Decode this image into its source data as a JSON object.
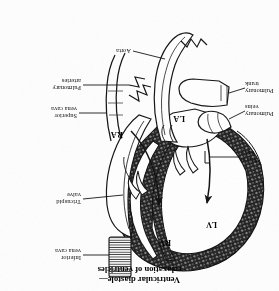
{
  "figure": {
    "orientation_note": "plate printed upside-down",
    "caption_line1": "Ventricular diastole—",
    "caption_line2": "relaxation of ventricles"
  },
  "chambers": [
    {
      "abbr": "LV",
      "name": "left ventricle"
    },
    {
      "abbr": "RV",
      "name": "right ventricle"
    },
    {
      "abbr": "LA",
      "name": "left atrium"
    },
    {
      "abbr": "RA",
      "name": "right atrium"
    }
  ],
  "labels": {
    "inferior_vena_cava_line1": "Inferior",
    "inferior_vena_cava_line2": "vena cava",
    "tricuspid_valve_line1": "Tricuspid",
    "tricuspid_valve_line2": "valve",
    "superior_vena_cava_line1": "Superior",
    "superior_vena_cava_line2": "vena cava",
    "pulmonary_arteries_line1": "Pulmonary",
    "pulmonary_arteries_line2": "arteries",
    "aorta": "Aorta",
    "mitral_valve_line1": "Mitral",
    "mitral_valve_line2": "valve",
    "pulmonary_veins_line1": "Pulmonary",
    "pulmonary_veins_line2": "veins",
    "pulmonary_trunk_line1": "Pulmonary",
    "pulmonary_trunk_line2": "trunk"
  },
  "colors": {
    "ink": "#111111",
    "myocardium": "#1a1a1a",
    "paper": "#ffffff"
  }
}
